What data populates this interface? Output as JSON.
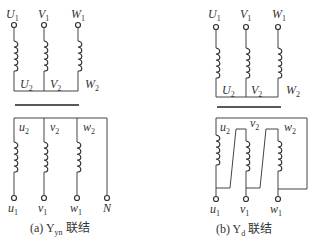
{
  "diagrams": [
    {
      "id": "a",
      "caption_prefix": "(a)",
      "caption_main": "Y",
      "caption_sub": "yn",
      "caption_suffix": " 联结",
      "primary": {
        "terminals": [
          {
            "main": "U",
            "sub": "1"
          },
          {
            "main": "V",
            "sub": "1"
          },
          {
            "main": "W",
            "sub": "1"
          }
        ],
        "ends": [
          {
            "main": "U",
            "sub": "2"
          },
          {
            "main": "V",
            "sub": "2"
          },
          {
            "main": "W",
            "sub": "2"
          }
        ]
      },
      "secondary": {
        "starts": [
          {
            "main": "u",
            "sub": "2"
          },
          {
            "main": "v",
            "sub": "2"
          },
          {
            "main": "w",
            "sub": "2"
          }
        ],
        "terminals": [
          {
            "main": "u",
            "sub": "1"
          },
          {
            "main": "v",
            "sub": "1"
          },
          {
            "main": "w",
            "sub": "1"
          },
          {
            "main": "N",
            "sub": ""
          }
        ]
      }
    },
    {
      "id": "b",
      "caption_prefix": "(b)",
      "caption_main": "Y",
      "caption_sub": "d",
      "caption_suffix": " 联结",
      "primary": {
        "terminals": [
          {
            "main": "U",
            "sub": "1"
          },
          {
            "main": "V",
            "sub": "1"
          },
          {
            "main": "W",
            "sub": "1"
          }
        ],
        "ends": [
          {
            "main": "U",
            "sub": "2"
          },
          {
            "main": "V",
            "sub": "2"
          },
          {
            "main": "W",
            "sub": "2"
          }
        ]
      },
      "secondary": {
        "starts": [
          {
            "main": "u",
            "sub": "2"
          },
          {
            "main": "v",
            "sub": "2"
          },
          {
            "main": "w",
            "sub": "2"
          }
        ],
        "terminals": [
          {
            "main": "u",
            "sub": "1"
          },
          {
            "main": "v",
            "sub": "1"
          },
          {
            "main": "w",
            "sub": "1"
          }
        ]
      }
    }
  ]
}
